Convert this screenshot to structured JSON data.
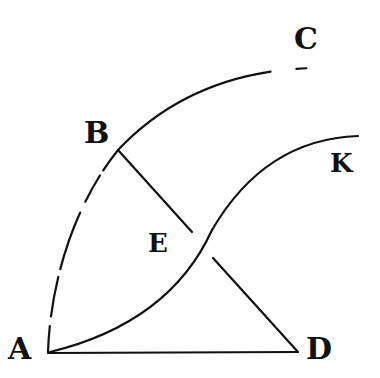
{
  "diagram": {
    "type": "geometric-construction",
    "points": {
      "A": {
        "label": "A",
        "x": 48,
        "y": 353
      },
      "B": {
        "label": "B",
        "x": 118,
        "y": 148
      },
      "C": {
        "label": "C",
        "x": 320,
        "y": 68
      },
      "D": {
        "label": "D",
        "x": 298,
        "y": 353
      },
      "E": {
        "label": "E",
        "x": 200,
        "y": 243
      },
      "K": {
        "label": "K",
        "x": 358,
        "y": 136
      }
    },
    "segments": [
      {
        "from": "A",
        "to": "D",
        "style": "solid"
      },
      {
        "from": "B",
        "to": "D",
        "style": "solid",
        "via": "E"
      }
    ],
    "arcs": [
      {
        "from": "A",
        "through": "B",
        "to": "C",
        "style": "dashed"
      },
      {
        "from": "A",
        "through": "E",
        "to": "K",
        "style": "solid"
      }
    ],
    "stroke_color": "#111111",
    "background": "#ffffff"
  }
}
